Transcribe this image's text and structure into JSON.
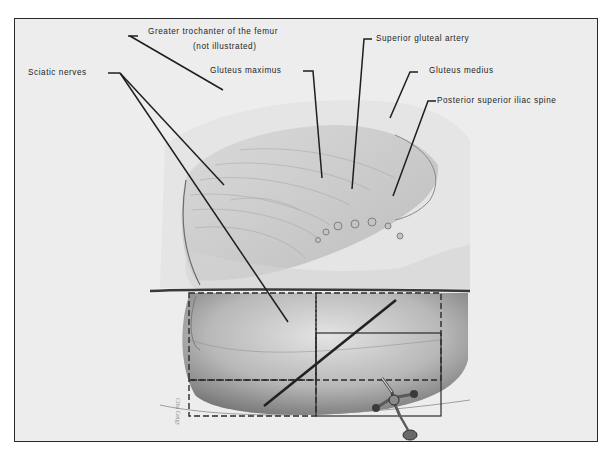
{
  "figure": {
    "labels": {
      "greater_trochanter": "Greater trochanter of the femur",
      "not_illustrated": "(not illustrated)",
      "sciatic_nerves": "Sciatic nerves",
      "gluteus_maximus": "Gluteus maximus",
      "superior_gluteal_artery": "Superior gluteal artery",
      "gluteus_medius": "Gluteus medius",
      "posterior_superior_iliac_spine": "Posterior superior iliac spine"
    },
    "quadrants": {
      "upper_outer": "dashed",
      "upper_inner": "dashed",
      "lower_outer": "dashed",
      "lower_inner": "solid"
    },
    "instrument": "syringe",
    "colors": {
      "background": "#ededed",
      "ink": "#1e1e1e",
      "frame": "#2a2a2a"
    }
  }
}
